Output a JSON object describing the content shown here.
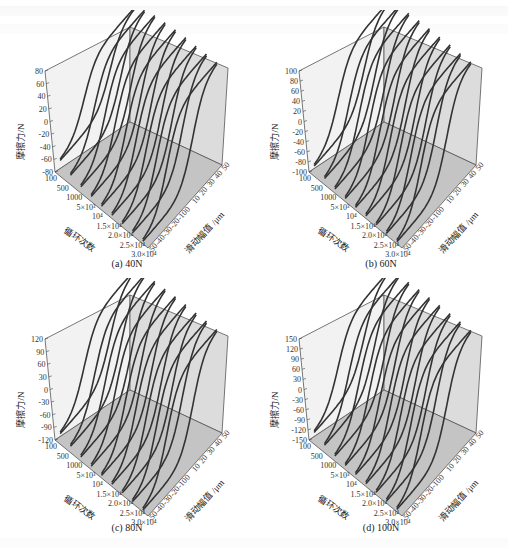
{
  "figure": {
    "panels": [
      {
        "id": "a",
        "caption": "(a) 40N",
        "z_ticks": [
          "80",
          "60",
          "40",
          "20",
          "0",
          "-20",
          "-40",
          "-60",
          "-80"
        ],
        "z_max": 80
      },
      {
        "id": "b",
        "caption": "(b) 60N",
        "z_ticks": [
          "100",
          "80",
          "60",
          "40",
          "20",
          "0",
          "-20",
          "-40",
          "-60",
          "-80",
          "-100"
        ],
        "z_max": 100
      },
      {
        "id": "c",
        "caption": "(c) 80N",
        "z_ticks": [
          "120",
          "90",
          "60",
          "30",
          "0",
          "-30",
          "-60",
          "-90",
          "-120"
        ],
        "z_max": 120
      },
      {
        "id": "d",
        "caption": "(d) 100N",
        "z_ticks": [
          "150",
          "120",
          "90",
          "60",
          "30",
          "0",
          "-30",
          "-60",
          "-90",
          "-120",
          "-150"
        ],
        "z_max": 150
      }
    ],
    "axis_labels": {
      "z": "摩擦力/N",
      "cycles": "循环次数",
      "amplitude": "滑动幅值 /μm"
    },
    "cycle_ticks": [
      "100",
      "500",
      "1000",
      "5×10³",
      "10⁴",
      "1.5×10⁴",
      "2.0×10⁴",
      "2.5×10⁴",
      "3.0×10⁴"
    ],
    "amp_ticks": [
      "-50",
      "-40",
      "-30",
      "-20",
      "-10",
      "0",
      "10",
      "20",
      "30",
      "40",
      "50"
    ]
  },
  "chart_data": [
    {
      "type": "line",
      "title": "(a) 40N",
      "xlabel": "滑动幅值 /μm",
      "ylabel": "循环次数",
      "zlabel": "摩擦力/N",
      "x_range": [
        -50,
        50
      ],
      "z_range": [
        -80,
        80
      ],
      "categories": [
        "100",
        "500",
        "1000",
        "5×10³",
        "10⁴",
        "1.5×10⁴",
        "2.0×10⁴",
        "2.5×10⁴",
        "3.0×10⁴"
      ],
      "series": [
        {
          "name": "fretting loops",
          "peak_friction": [
            55,
            65,
            70,
            72,
            74,
            75,
            75,
            76,
            76
          ]
        }
      ]
    },
    {
      "type": "line",
      "title": "(b) 60N",
      "xlabel": "滑动幅值 /μm",
      "ylabel": "循环次数",
      "zlabel": "摩擦力/N",
      "x_range": [
        -50,
        50
      ],
      "z_range": [
        -100,
        100
      ],
      "categories": [
        "100",
        "500",
        "1000",
        "5×10³",
        "10⁴",
        "1.5×10⁴",
        "2.0×10⁴",
        "2.5×10⁴",
        "3.0×10⁴"
      ],
      "series": [
        {
          "name": "fretting loops",
          "peak_friction": [
            80,
            88,
            92,
            94,
            95,
            95,
            96,
            96,
            96
          ]
        }
      ]
    },
    {
      "type": "line",
      "title": "(c) 80N",
      "xlabel": "滑动幅值 /μm",
      "ylabel": "循环次数",
      "zlabel": "摩擦力/N",
      "x_range": [
        -50,
        50
      ],
      "z_range": [
        -120,
        120
      ],
      "categories": [
        "100",
        "500",
        "1000",
        "5×10³",
        "10⁴",
        "1.5×10⁴",
        "2.0×10⁴",
        "2.5×10⁴",
        "3.0×10⁴"
      ],
      "series": [
        {
          "name": "fretting loops",
          "peak_friction": [
            95,
            105,
            110,
            112,
            114,
            115,
            115,
            116,
            116
          ]
        }
      ]
    },
    {
      "type": "line",
      "title": "(d) 100N",
      "xlabel": "滑动幅值 /μm",
      "ylabel": "循环次数",
      "zlabel": "摩擦力/N",
      "x_range": [
        -50,
        50
      ],
      "z_range": [
        -150,
        150
      ],
      "categories": [
        "100",
        "500",
        "1000",
        "5×10³",
        "10⁴",
        "1.5×10⁴",
        "2.0×10⁴",
        "2.5×10⁴",
        "3.0×10⁴"
      ],
      "series": [
        {
          "name": "fretting loops",
          "peak_friction": [
            115,
            128,
            135,
            138,
            140,
            142,
            142,
            143,
            143
          ]
        }
      ]
    }
  ]
}
